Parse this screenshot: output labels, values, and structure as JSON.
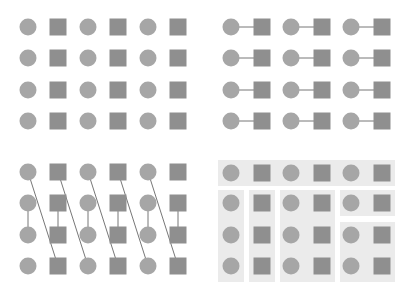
{
  "diagram": {
    "colors": {
      "circle": "#a6a6a6",
      "square": "#8f8f8f",
      "line": "#777777",
      "box": "#ebebeb",
      "background": "#ffffff"
    },
    "panels": [
      {
        "name": "proximity-grid",
        "rows": 4,
        "cols": 6,
        "pattern": [
          "circle",
          "square",
          "circle",
          "square",
          "circle",
          "square"
        ],
        "connections": "none"
      },
      {
        "name": "horizontal-connected-pairs",
        "rows": 4,
        "cols": 6,
        "pattern": [
          "circle",
          "square",
          "circle",
          "square",
          "circle",
          "square"
        ],
        "connections": "each circle linked to adjacent square"
      },
      {
        "name": "diagonal-vertical-links",
        "rows": 4,
        "cols": 6,
        "pattern": [
          "circle",
          "square",
          "circle",
          "square",
          "circle",
          "square"
        ],
        "connections": "diagonal lines from row 1 to row 4 of next column; vertical links between rows 2 and 3"
      },
      {
        "name": "common-region-boxes",
        "rows": 4,
        "cols": 6,
        "pattern": [
          "circle",
          "square",
          "circle",
          "square",
          "circle",
          "square"
        ],
        "connections": "shaded enclosing regions"
      }
    ]
  }
}
